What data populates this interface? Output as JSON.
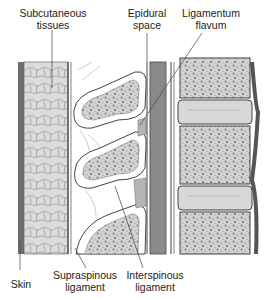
{
  "figure": {
    "labels": {
      "subcutaneous": [
        "Subcutaneous",
        "tissues"
      ],
      "epidural": [
        "Epidural",
        "space"
      ],
      "flavum": [
        "Ligamentum",
        "flavum"
      ],
      "skin": "Skin",
      "supraspinous": [
        "Supraspinous",
        "ligament"
      ],
      "interspinous": [
        "Interspinous",
        "ligament"
      ]
    },
    "colors": {
      "background": "#ffffff",
      "line": "#4a4a4a",
      "skin": "#6f6f6f",
      "subcutaneous_fill": "#dcdcdc",
      "bone_fill": "#d2d2d2",
      "bone_speckle": "#7a7a7a",
      "cortex_fill": "#ffffff",
      "dura_fill": "#8a8a8a",
      "disc_fill": "#d8d8d8",
      "ligament_fill": "#b5b5b5"
    }
  }
}
